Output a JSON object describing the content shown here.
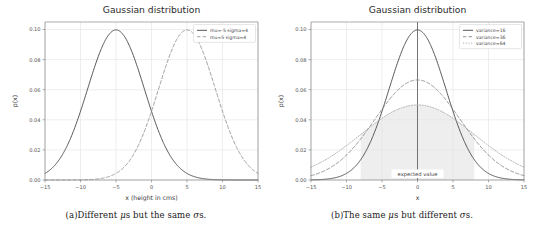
{
  "figure": {
    "panels": [
      {
        "id": "a",
        "title": "Gaussian distribution",
        "caption_prefix": "(a)",
        "caption_text_1": "Different ",
        "caption_mu": "μ",
        "caption_text_2": "s but the same ",
        "caption_sigma": "σ",
        "caption_text_3": "s.",
        "caption_plain": "(a) Different μs but the same σs.",
        "chart_data": {
          "type": "line",
          "title": "Gaussian distribution",
          "xlabel": "x (height in cms)",
          "ylabel": "p(x)",
          "xlim": [
            -15,
            15
          ],
          "ylim": [
            0.0,
            0.105
          ],
          "xticks": [
            -15,
            -10,
            -5,
            0,
            5,
            10,
            15
          ],
          "xticklabels": [
            "−15",
            "−10",
            "−5",
            "0",
            "5",
            "10",
            "15"
          ],
          "yticks": [
            0.0,
            0.02,
            0.04,
            0.06,
            0.08,
            0.1
          ],
          "yticklabels": [
            "0.00",
            "0.02",
            "0.04",
            "0.06",
            "0.08",
            "0.10"
          ],
          "grid": true,
          "legend_position": "upper right",
          "series": [
            {
              "name": "mu=-5 sigma=4",
              "mu": -5,
              "sigma": 4,
              "peak": 0.0997,
              "linestyle": "solid",
              "color": "#4d4d4d"
            },
            {
              "name": "mu=5 sigma=4",
              "mu": 5,
              "sigma": 4,
              "peak": 0.0997,
              "linestyle": "dashed",
              "color": "#9a9a9a"
            }
          ]
        }
      },
      {
        "id": "b",
        "title": "Gaussian distribution",
        "caption_prefix": "(b)",
        "caption_text_1": "The same ",
        "caption_mu": "μ",
        "caption_text_2": "s but different ",
        "caption_sigma": "σ",
        "caption_text_3": "s.",
        "caption_plain": "(b) The same μs but different σs.",
        "annotation": "expected value",
        "chart_data": {
          "type": "line",
          "title": "Gaussian distribution",
          "xlabel": "x",
          "ylabel": "p(x)",
          "xlim": [
            -15,
            15
          ],
          "ylim": [
            0.0,
            0.105
          ],
          "xticks": [
            -15,
            -10,
            -5,
            0,
            5,
            10,
            15
          ],
          "xticklabels": [
            "−15",
            "−10",
            "−5",
            "0",
            "5",
            "10",
            "15"
          ],
          "yticks": [
            0.0,
            0.02,
            0.04,
            0.06,
            0.08,
            0.1
          ],
          "yticklabels": [
            "0.00",
            "0.02",
            "0.04",
            "0.06",
            "0.08",
            "0.10"
          ],
          "grid": true,
          "legend_position": "upper right",
          "expected_value_line_x": 0,
          "shaded_region": {
            "from": -8,
            "to": 8,
            "under_series": "variance=64",
            "color": "#eeeeee"
          },
          "series": [
            {
              "name": "variance=16",
              "mu": 0,
              "sigma": 4,
              "variance": 16,
              "peak": 0.0997,
              "linestyle": "solid",
              "color": "#4d4d4d"
            },
            {
              "name": "variance=36",
              "mu": 0,
              "sigma": 6,
              "variance": 36,
              "peak": 0.0665,
              "linestyle": "dashed",
              "color": "#8c8c8c"
            },
            {
              "name": "variance=64",
              "mu": 0,
              "sigma": 8,
              "variance": 64,
              "peak": 0.0499,
              "linestyle": "dotted",
              "color": "#a8a8a8"
            }
          ]
        }
      }
    ]
  },
  "colors": {
    "background": "#ffffff",
    "axis": "#888888",
    "grid": "#e3e3e3",
    "text": "#3a3a3a",
    "shade": "#efefef"
  }
}
